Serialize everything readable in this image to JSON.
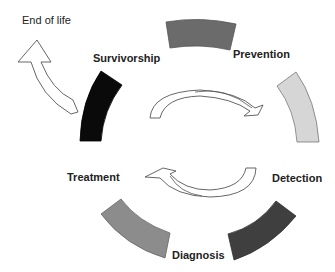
{
  "diagram": {
    "type": "cycle",
    "stages": [
      {
        "label": "Prevention",
        "color": "#6b6b6b"
      },
      {
        "label": "Detection",
        "color": "#d6d6d6"
      },
      {
        "label": "Diagnosis",
        "color": "#3f3f3f"
      },
      {
        "label": "Treatment",
        "color": "#8c8c8c"
      },
      {
        "label": "Survivorship",
        "color": "#0a0a0a"
      }
    ],
    "exit": {
      "label": "End of life"
    },
    "center_arrows": [
      "clockwise-top-arrow",
      "clockwise-bottom-arrow"
    ]
  }
}
